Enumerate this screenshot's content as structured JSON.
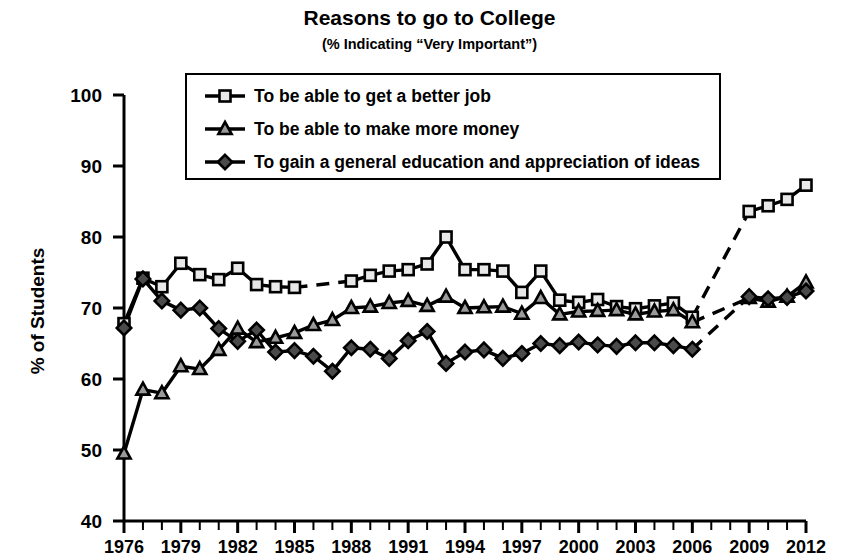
{
  "chart_data": {
    "type": "line",
    "title": "Reasons to go to College",
    "subtitle": "(% Indicating “Very Important”)",
    "xlabel": "",
    "ylabel": "% of Students",
    "ylim": [
      40,
      100
    ],
    "ytick_step": 10,
    "yticks": [
      "40",
      "50",
      "60",
      "70",
      "80",
      "90",
      "100"
    ],
    "xlim": [
      1976,
      2012
    ],
    "xticks_labeled": [
      "1976",
      "1979",
      "1982",
      "1985",
      "1988",
      "1991",
      "1994",
      "1997",
      "2000",
      "2003",
      "2006",
      "2009",
      "2012"
    ],
    "xtick_minor_every": 1,
    "grid": false,
    "legend_position": "upper-left-inside",
    "x": [
      1976,
      1977,
      1978,
      1979,
      1980,
      1981,
      1982,
      1983,
      1984,
      1985,
      1986,
      1987,
      1988,
      1989,
      1990,
      1991,
      1992,
      1993,
      1994,
      1995,
      1996,
      1997,
      1998,
      1999,
      2000,
      2001,
      2002,
      2003,
      2004,
      2005,
      2006,
      2007,
      2008,
      2009,
      2010,
      2011,
      2012
    ],
    "series": [
      {
        "name": "To be able to get a better job",
        "marker": "square",
        "values": [
          67.8,
          74.2,
          73.0,
          76.3,
          74.7,
          74.0,
          75.6,
          73.3,
          73.0,
          72.9,
          null,
          null,
          73.8,
          74.6,
          75.2,
          75.4,
          76.2,
          80.0,
          75.4,
          75.4,
          75.2,
          72.2,
          75.2,
          71.1,
          70.8,
          71.2,
          70.2,
          69.9,
          70.3,
          70.7,
          68.7,
          null,
          null,
          83.6,
          84.4,
          85.3,
          87.3
        ],
        "gaps": [
          [
            1985,
            1988
          ],
          [
            2006,
            2009
          ]
        ]
      },
      {
        "name": "To be able to make more money",
        "marker": "triangle",
        "values": [
          49.5,
          58.5,
          58.0,
          61.8,
          61.4,
          64.1,
          67.1,
          65.2,
          65.8,
          66.5,
          67.6,
          68.3,
          70.0,
          70.2,
          70.7,
          71.0,
          70.3,
          71.6,
          70.0,
          70.1,
          70.2,
          69.2,
          71.4,
          69.1,
          69.5,
          69.6,
          69.7,
          69.1,
          69.5,
          69.7,
          68.0,
          null,
          null,
          71.4,
          70.9,
          71.6,
          73.6
        ],
        "gaps": [
          [
            2006,
            2009
          ]
        ]
      },
      {
        "name": "To gain a general education and appreciation of ideas",
        "marker": "diamond",
        "values": [
          67.2,
          74.1,
          71.0,
          69.7,
          70.0,
          67.1,
          65.3,
          66.9,
          63.8,
          64.0,
          63.2,
          61.1,
          64.4,
          64.2,
          62.9,
          65.4,
          66.7,
          62.2,
          63.8,
          64.1,
          62.9,
          63.6,
          65.0,
          64.7,
          65.2,
          64.8,
          64.6,
          65.1,
          65.1,
          64.7,
          64.2,
          null,
          null,
          71.6,
          71.3,
          71.5,
          72.4
        ],
        "gaps": [
          [
            2006,
            2009
          ]
        ]
      }
    ]
  },
  "legend": {
    "items": [
      {
        "label": "To be able to get a better job",
        "marker": "square"
      },
      {
        "label": "To be able to make more money",
        "marker": "triangle"
      },
      {
        "label": "To gain a general education and appreciation of ideas",
        "marker": "diamond"
      }
    ]
  }
}
